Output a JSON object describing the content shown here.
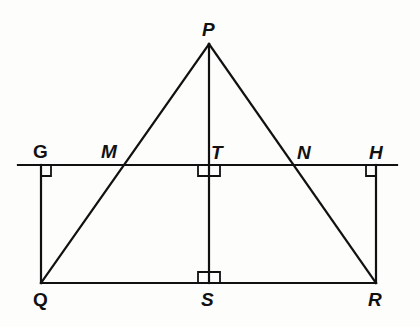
{
  "diagram": {
    "colors": {
      "stroke": "#111111",
      "background": "#fdfdfb"
    },
    "points": {
      "P": {
        "label": "P",
        "x": 209,
        "y": 44
      },
      "G": {
        "label": "G",
        "x": 41,
        "y": 165
      },
      "M": {
        "label": "M",
        "x": 124,
        "y": 165
      },
      "T": {
        "label": "T",
        "x": 209,
        "y": 165
      },
      "N": {
        "label": "N",
        "x": 295,
        "y": 165
      },
      "H": {
        "label": "H",
        "x": 376,
        "y": 165
      },
      "Q": {
        "label": "Q",
        "x": 41,
        "y": 283
      },
      "S": {
        "label": "S",
        "x": 209,
        "y": 283
      },
      "R": {
        "label": "R",
        "x": 376,
        "y": 283
      }
    },
    "segments": [
      {
        "from": "P",
        "to": "Q",
        "name": "side-PQ"
      },
      {
        "from": "P",
        "to": "R",
        "name": "side-PR"
      },
      {
        "from": "Q",
        "to": "R",
        "name": "side-QR"
      },
      {
        "from": "P",
        "to": "S",
        "name": "altitude-PS"
      },
      {
        "from": "G",
        "to": "Q",
        "name": "segment-GQ"
      },
      {
        "from": "H",
        "to": "R",
        "name": "segment-HR"
      },
      {
        "from": "line-left",
        "to": "line-right",
        "name": "line-GH"
      }
    ],
    "right_angles": [
      "G",
      "T",
      "H",
      "S"
    ],
    "labels": {
      "P": "P",
      "G": "G",
      "M": "M",
      "T": "T",
      "N": "N",
      "H": "H",
      "Q": "Q",
      "S": "S",
      "R": "R"
    }
  }
}
